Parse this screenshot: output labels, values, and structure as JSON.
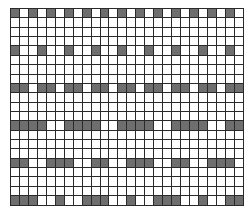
{
  "grid": {
    "columns": 26,
    "rows": 21,
    "colors": {
      "filled": "#6e6e6e",
      "empty": "#ffffff",
      "line": "#2a2a2a"
    },
    "filled_rows": [
      {
        "row": 0,
        "pattern": "1 on, 1 off",
        "cols": [
          0,
          2,
          4,
          6,
          8,
          10,
          12,
          14,
          16,
          18,
          20,
          22,
          24
        ]
      },
      {
        "row": 4,
        "pattern": "1 on, 2 off",
        "cols": [
          0,
          3,
          6,
          9,
          12,
          15,
          18,
          21,
          24
        ]
      },
      {
        "row": 8,
        "pattern": "2 on, 1 off",
        "cols": [
          0,
          1,
          3,
          4,
          6,
          7,
          9,
          10,
          12,
          13,
          15,
          16,
          18,
          19,
          21,
          22,
          24,
          25
        ]
      },
      {
        "row": 12,
        "pattern": "4 on, 2 off",
        "cols": [
          0,
          1,
          2,
          3,
          6,
          7,
          8,
          9,
          12,
          13,
          14,
          15,
          18,
          19,
          20,
          21,
          24,
          25
        ]
      },
      {
        "row": 16,
        "pattern": "2 on, 2 off, 3 on, 2 off",
        "cols": [
          0,
          1,
          4,
          5,
          6,
          9,
          10,
          13,
          14,
          15,
          18,
          19,
          22,
          23,
          24
        ]
      },
      {
        "row": 20,
        "pattern": "3 on, 2 off, 1 on, 2 off",
        "cols": [
          0,
          1,
          2,
          5,
          8,
          9,
          10,
          13,
          16,
          17,
          18,
          21,
          24,
          25
        ]
      }
    ]
  }
}
